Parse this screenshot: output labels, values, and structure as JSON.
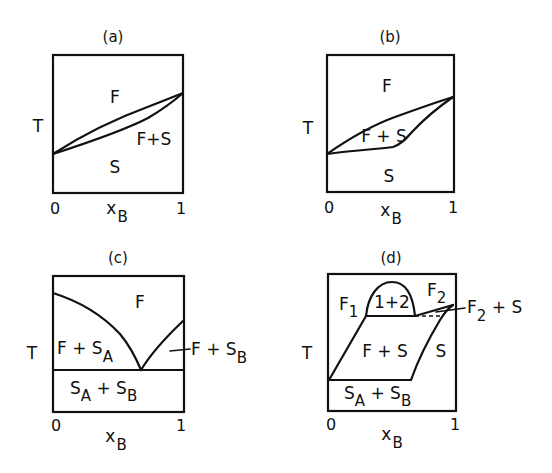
{
  "panels": [
    {
      "id": "a",
      "title": "(a)",
      "y_axis": "T",
      "x_axis": {
        "label": "x",
        "subscript": "B",
        "ticks": [
          "0",
          "1"
        ]
      },
      "regions": [
        {
          "text": "F"
        },
        {
          "text": "F+S"
        },
        {
          "text": "S"
        }
      ]
    },
    {
      "id": "b",
      "title": "(b)",
      "y_axis": "T",
      "x_axis": {
        "label": "x",
        "subscript": "B",
        "ticks": [
          "0",
          "1"
        ]
      },
      "regions": [
        {
          "text": "F"
        },
        {
          "text": "F + S"
        },
        {
          "text": "S"
        }
      ]
    },
    {
      "id": "c",
      "title": "(c)",
      "y_axis": "T",
      "x_axis": {
        "label": "x",
        "subscript": "B",
        "ticks": [
          "0",
          "1"
        ]
      },
      "regions": [
        {
          "text": "F"
        },
        {
          "text": "F + S",
          "sub": "A"
        },
        {
          "text": "F + S",
          "sub": "B"
        },
        {
          "text_1": "S",
          "sub_1": "A",
          "mid": " + S",
          "sub_2": "B"
        }
      ]
    },
    {
      "id": "d",
      "title": "(d)",
      "y_axis": "T",
      "x_axis": {
        "label": "x",
        "subscript": "B",
        "ticks": [
          "0",
          "1"
        ]
      },
      "regions": [
        {
          "text": "F",
          "sub": "1"
        },
        {
          "text": "1+2"
        },
        {
          "text": "F",
          "sub": "2"
        },
        {
          "text": "F",
          "sub": "2",
          "tail": " + S"
        },
        {
          "text": "F + S"
        },
        {
          "text": "S"
        },
        {
          "text_1": "S",
          "sub_1": "A",
          "mid": " + S",
          "sub_2": "B"
        }
      ]
    }
  ]
}
